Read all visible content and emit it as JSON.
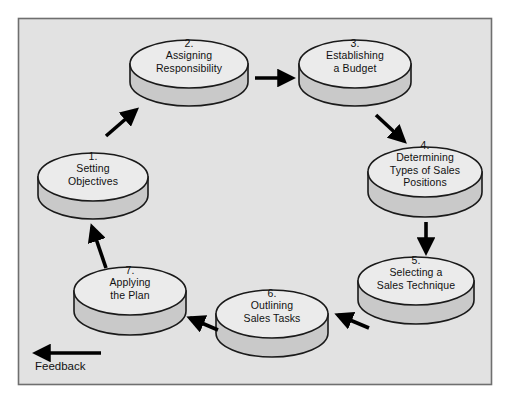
{
  "diagram": {
    "type": "cycle-flowchart",
    "frame": {
      "fill": "#e2e2e2",
      "border": "#6f6f6f"
    },
    "style": {
      "cylinder_top_fill": "#ebebeb",
      "cylinder_body_fill": "#c9c9c9",
      "outline": "#1a1a1a",
      "arrow_color": "#000000",
      "text_color": "#111111",
      "canvas_background": "#ffffff"
    },
    "nodes": [
      {
        "id": "node-1",
        "name": "setting-objectives",
        "number": "1.",
        "lines": [
          "Setting",
          "Objectives"
        ]
      },
      {
        "id": "node-2",
        "name": "assigning-responsibility",
        "number": "2.",
        "lines": [
          "Assigning",
          "Responsibility"
        ]
      },
      {
        "id": "node-3",
        "name": "establishing-a-budget",
        "number": "3.",
        "lines": [
          "Establishing",
          "a Budget"
        ]
      },
      {
        "id": "node-4",
        "name": "determining-types-of-sales-positions",
        "number": "4.",
        "lines": [
          "Determining",
          "Types of Sales",
          "Positions"
        ]
      },
      {
        "id": "node-5",
        "name": "selecting-a-sales-technique",
        "number": "5.",
        "lines": [
          "Selecting a",
          "Sales Technique"
        ]
      },
      {
        "id": "node-6",
        "name": "outlining-sales-tasks",
        "number": "6.",
        "lines": [
          "Outlining",
          "Sales Tasks"
        ]
      },
      {
        "id": "node-7",
        "name": "applying-the-plan",
        "number": "7.",
        "lines": [
          "Applying",
          "the Plan"
        ]
      }
    ],
    "connectors": [
      {
        "from": "node-1",
        "to": "node-2",
        "name": "arrow-1-to-2"
      },
      {
        "from": "node-2",
        "to": "node-3",
        "name": "arrow-2-to-3"
      },
      {
        "from": "node-3",
        "to": "node-4",
        "name": "arrow-3-to-4"
      },
      {
        "from": "node-4",
        "to": "node-5",
        "name": "arrow-4-to-5"
      },
      {
        "from": "node-5",
        "to": "node-6",
        "name": "arrow-5-to-6"
      },
      {
        "from": "node-6",
        "to": "node-7",
        "name": "arrow-6-to-7"
      },
      {
        "from": "node-7",
        "to": "node-1",
        "name": "arrow-7-to-1"
      }
    ],
    "feedback": {
      "label": "Feedback",
      "name": "feedback-arrow"
    }
  }
}
